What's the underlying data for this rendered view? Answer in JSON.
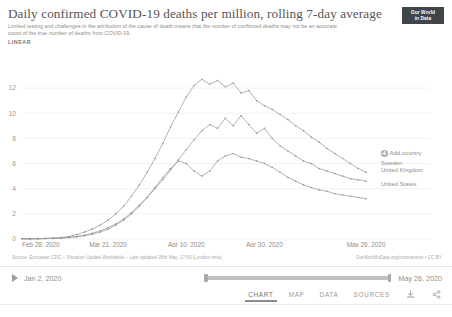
{
  "header": {
    "title": "Daily confirmed COVID-19 deaths per million, rolling 7-day average",
    "subtitle": "Limited testing and challenges in the attribution of the cause of death means that the number of confirmed deaths may not be an accurate count of the true number of deaths from COVID-19.",
    "scale_label": "LINEAR",
    "logo_line1": "Our World",
    "logo_line2": "in Data"
  },
  "legend": {
    "add_country_label": "Add country",
    "entries": [
      {
        "name": "Sweden",
        "color": "#8d8d8d"
      },
      {
        "name": "United Kingdom",
        "color": "#8d8d8d"
      },
      {
        "name": "United States",
        "color": "#8d8d8d"
      }
    ]
  },
  "footer": {
    "source": "Source: European CDC – Situation Update Worldwide – Last updated 26th May, 17:00 (London time)",
    "attribution": "OurWorldInData.org/coronavirus • CC BY"
  },
  "timeline": {
    "play_icon": "play-icon",
    "start_date": "Jan 2, 2020",
    "end_date": "May 26, 2020"
  },
  "tabs": [
    {
      "label": "CHART",
      "active": true
    },
    {
      "label": "MAP",
      "active": false
    },
    {
      "label": "DATA",
      "active": false
    },
    {
      "label": "SOURCES",
      "active": false
    }
  ],
  "actions": [
    {
      "name": "download-icon",
      "label": "Download"
    },
    {
      "name": "share-icon",
      "label": "Share"
    }
  ],
  "chart_data": {
    "type": "line",
    "title": "Daily confirmed COVID-19 deaths per million, rolling 7-day average",
    "subtitle": "Limited testing and challenges in the attribution of the cause of death means that the number of confirmed deaths may not be an accurate count of the true number of deaths from COVID-19.",
    "xlabel": "",
    "ylabel": "",
    "scale": "linear",
    "grid": true,
    "legend_position": "right-inline",
    "ylim": [
      0,
      13.2
    ],
    "yticks": [
      0,
      2,
      4,
      6,
      8,
      10,
      12
    ],
    "xtick_labels": [
      "Feb 28, 2020",
      "Mar 21, 2020",
      "Apr 10, 2020",
      "Apr 30, 2020",
      "May 26, 2020"
    ],
    "xtick_positions": [
      0,
      22,
      42,
      62,
      88
    ],
    "xlim": [
      0,
      89
    ],
    "x_unit": "days since Feb 28, 2020",
    "series": [
      {
        "name": "United Kingdom",
        "color": "#8d8d8d",
        "x": [
          0,
          2,
          4,
          6,
          8,
          10,
          12,
          14,
          16,
          18,
          20,
          22,
          24,
          26,
          28,
          30,
          32,
          34,
          36,
          38,
          40,
          42,
          44,
          46,
          48,
          50,
          52,
          54,
          56,
          58,
          60,
          62,
          64,
          66,
          68,
          70,
          72,
          74,
          76,
          78,
          80,
          82,
          84,
          86,
          88
        ],
        "values": [
          0.02,
          0.02,
          0.03,
          0.05,
          0.08,
          0.12,
          0.2,
          0.35,
          0.55,
          0.8,
          1.1,
          1.5,
          2.0,
          2.6,
          3.4,
          4.3,
          5.3,
          6.4,
          7.6,
          8.9,
          10.1,
          11.3,
          12.2,
          12.7,
          12.3,
          12.6,
          12.1,
          12.4,
          11.6,
          11.8,
          11.0,
          10.6,
          10.3,
          9.9,
          9.5,
          9.0,
          8.6,
          8.1,
          7.7,
          7.2,
          6.8,
          6.4,
          6.0,
          5.6,
          5.3
        ]
      },
      {
        "name": "Sweden",
        "color": "#8d8d8d",
        "x": [
          0,
          2,
          4,
          6,
          8,
          10,
          12,
          14,
          16,
          18,
          20,
          22,
          24,
          26,
          28,
          30,
          32,
          34,
          36,
          38,
          40,
          42,
          44,
          46,
          48,
          50,
          52,
          54,
          56,
          58,
          60,
          62,
          64,
          66,
          68,
          70,
          72,
          74,
          76,
          78,
          80,
          82,
          84,
          86,
          88
        ],
        "values": [
          0.01,
          0.01,
          0.02,
          0.03,
          0.05,
          0.08,
          0.13,
          0.2,
          0.3,
          0.45,
          0.65,
          0.9,
          1.2,
          1.6,
          2.1,
          2.7,
          3.3,
          4.0,
          4.7,
          5.5,
          6.3,
          7.1,
          7.9,
          8.6,
          9.1,
          8.8,
          9.6,
          9.0,
          9.8,
          9.1,
          8.4,
          8.8,
          8.0,
          7.4,
          7.0,
          6.6,
          6.2,
          6.0,
          5.6,
          5.4,
          5.2,
          5.0,
          4.8,
          4.7,
          4.6
        ]
      },
      {
        "name": "United States",
        "color": "#8d8d8d",
        "x": [
          0,
          2,
          4,
          6,
          8,
          10,
          12,
          14,
          16,
          18,
          20,
          22,
          24,
          26,
          28,
          30,
          32,
          34,
          36,
          38,
          40,
          42,
          44,
          46,
          48,
          50,
          52,
          54,
          56,
          58,
          60,
          62,
          64,
          66,
          68,
          70,
          72,
          74,
          76,
          78,
          80,
          82,
          84,
          86,
          88
        ],
        "values": [
          0.01,
          0.01,
          0.02,
          0.03,
          0.05,
          0.07,
          0.11,
          0.17,
          0.26,
          0.38,
          0.55,
          0.78,
          1.1,
          1.5,
          2.0,
          2.6,
          3.3,
          4.1,
          4.9,
          5.6,
          6.2,
          6.0,
          5.4,
          5.0,
          5.4,
          6.2,
          6.6,
          6.8,
          6.5,
          6.4,
          6.2,
          6.0,
          5.7,
          5.3,
          4.9,
          4.6,
          4.3,
          4.1,
          3.9,
          3.8,
          3.6,
          3.5,
          3.4,
          3.3,
          3.2
        ]
      }
    ]
  }
}
